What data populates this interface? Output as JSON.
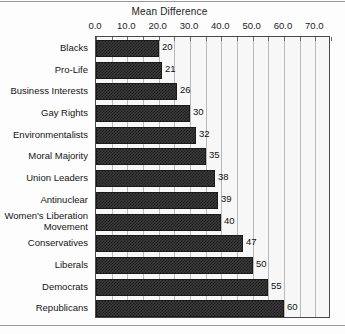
{
  "chart_data": {
    "type": "bar",
    "orientation": "horizontal",
    "title": "Mean Difference",
    "xlabel": "",
    "ylabel": "",
    "xlim": [
      0,
      75
    ],
    "xticks": [
      "0.0",
      "10.0",
      "20.0",
      "30.0",
      "40.0",
      "50.0",
      "60.0",
      "70.0"
    ],
    "xtick_values": [
      0,
      10,
      20,
      30,
      40,
      50,
      60,
      70
    ],
    "minor_tick_interval": 5,
    "grid": true,
    "grid_axis": "x",
    "legend": null,
    "axis_position": "top",
    "categories": [
      "Blacks",
      "Pro-Life",
      "Business Interests",
      "Gay Rights",
      "Environmentalists",
      "Moral Majority",
      "Union Leaders",
      "Antinuclear",
      "Women's Liberation\nMovement",
      "Conservatives",
      "Liberals",
      "Democrats",
      "Republicans"
    ],
    "values": [
      20,
      21,
      26,
      30,
      32,
      35,
      38,
      39,
      40,
      47,
      50,
      55,
      60
    ],
    "data_labels": [
      "20",
      "21",
      "26",
      "30",
      "32",
      "35",
      "38",
      "39",
      "40",
      "47",
      "50",
      "55",
      "60"
    ],
    "bar_color": "#2b2b2b",
    "bar_pattern": "dense-checker",
    "plot_background": "#f7f7f7",
    "grid_color": "#b9b9b9",
    "frame_color": "#4a4a4a"
  }
}
